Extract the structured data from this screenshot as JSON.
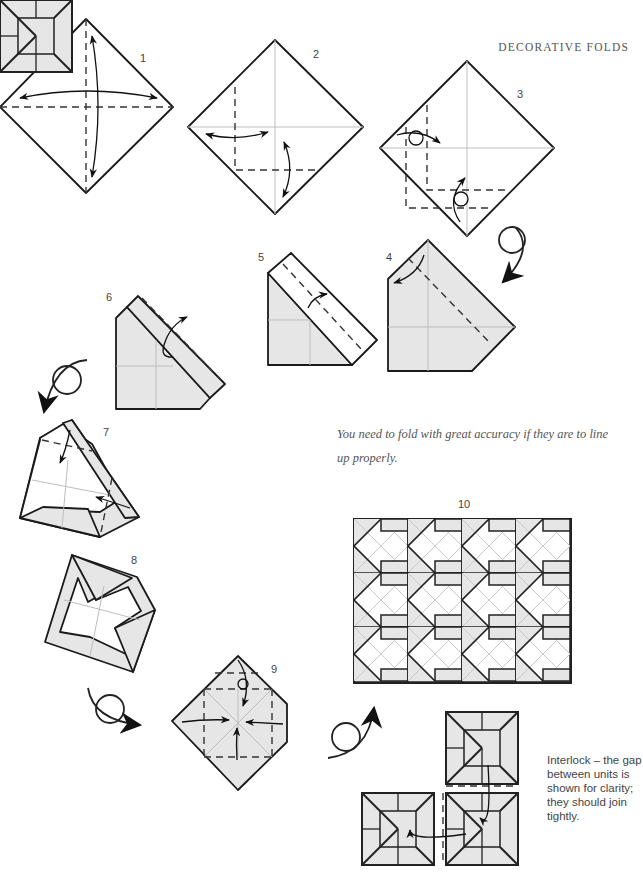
{
  "header": {
    "section_title": "DECORATIVE FOLDS"
  },
  "steps": [
    {
      "number": "1"
    },
    {
      "number": "2"
    },
    {
      "number": "3"
    },
    {
      "number": "4"
    },
    {
      "number": "5"
    },
    {
      "number": "6"
    },
    {
      "number": "7"
    },
    {
      "number": "8"
    },
    {
      "number": "9"
    },
    {
      "number": "10"
    }
  ],
  "caption": "You need to fold with great accuracy if they are to line up properly.",
  "interlock_note": "Interlock – the gap between units is shown for clarity; they should join tightly.",
  "colors": {
    "paper_shade": "#e6e6e6",
    "line": "#1a1a1a",
    "crease": "#bdbdbd",
    "text": "#555555"
  }
}
